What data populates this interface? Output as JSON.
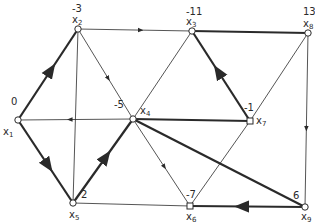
{
  "diagram": {
    "type": "directed-graph",
    "colors": {
      "edge": "#2a2a2a",
      "background": "#ffffff"
    },
    "nodes": [
      {
        "id": "x1",
        "name": "x",
        "sub": "1",
        "value": "0",
        "x": 18,
        "y": 120,
        "shape": "circle"
      },
      {
        "id": "x2",
        "name": "x",
        "sub": "2",
        "value": "-3",
        "x": 78,
        "y": 29,
        "shape": "circle"
      },
      {
        "id": "x3",
        "name": "x",
        "sub": "3",
        "value": "-11",
        "x": 192,
        "y": 31,
        "shape": "circle"
      },
      {
        "id": "x4",
        "name": "x",
        "sub": "4",
        "value": "-5",
        "x": 133,
        "y": 119,
        "shape": "circle"
      },
      {
        "id": "x5",
        "name": "x",
        "sub": "5",
        "value": "2",
        "x": 73,
        "y": 203,
        "shape": "circle"
      },
      {
        "id": "x6",
        "name": "x",
        "sub": "6",
        "value": "-7",
        "x": 190,
        "y": 206,
        "shape": "square"
      },
      {
        "id": "x7",
        "name": "x",
        "sub": "7",
        "value": "-1",
        "x": 250,
        "y": 121,
        "shape": "square"
      },
      {
        "id": "x8",
        "name": "x",
        "sub": "8",
        "value": "13",
        "x": 308,
        "y": 33,
        "shape": "circle"
      },
      {
        "id": "x9",
        "name": "x",
        "sub": "9",
        "value": "6",
        "x": 305,
        "y": 207,
        "shape": "circle"
      }
    ],
    "edges": [
      {
        "from": "x1",
        "to": "x2",
        "bold": true,
        "arrow": true
      },
      {
        "from": "x2",
        "to": "x3",
        "bold": false,
        "arrow": true
      },
      {
        "from": "x2",
        "to": "x4",
        "bold": false,
        "arrow": true
      },
      {
        "from": "x2",
        "to": "x5",
        "bold": false,
        "arrow": false
      },
      {
        "from": "x3",
        "to": "x8",
        "bold": true,
        "arrow": false
      },
      {
        "from": "x7",
        "to": "x3",
        "bold": true,
        "arrow": true
      },
      {
        "from": "x3",
        "to": "x4",
        "bold": false,
        "arrow": false
      },
      {
        "from": "x8",
        "to": "x7",
        "bold": false,
        "arrow": false
      },
      {
        "from": "x8",
        "to": "x9",
        "bold": false,
        "arrow": true
      },
      {
        "from": "x4",
        "to": "x1",
        "bold": false,
        "arrow": true
      },
      {
        "from": "x4",
        "to": "x7",
        "bold": true,
        "arrow": false
      },
      {
        "from": "x4",
        "to": "x9",
        "bold": true,
        "arrow": false
      },
      {
        "from": "x4",
        "to": "x6",
        "bold": false,
        "arrow": true
      },
      {
        "from": "x5",
        "to": "x4",
        "bold": true,
        "arrow": true
      },
      {
        "from": "x1",
        "to": "x5",
        "bold": true,
        "arrow": true
      },
      {
        "from": "x5",
        "to": "x6",
        "bold": false,
        "arrow": false
      },
      {
        "from": "x7",
        "to": "x6",
        "bold": false,
        "arrow": false
      },
      {
        "from": "x9",
        "to": "x6",
        "bold": true,
        "arrow": true
      }
    ],
    "labels": {
      "x1": {
        "value": "0",
        "value_pos": [
          11,
          97
        ],
        "name_pos": [
          3,
          127
        ]
      },
      "x2": {
        "value": "-3",
        "value_pos": [
          72,
          4
        ],
        "name_pos": [
          72,
          15
        ]
      },
      "x3": {
        "value": "-11",
        "value_pos": [
          186,
          7
        ],
        "name_pos": [
          186,
          17
        ]
      },
      "x4": {
        "value": "-5",
        "value_pos": [
          114,
          100
        ],
        "name_pos": [
          140,
          106
        ]
      },
      "x5": {
        "value": "2",
        "value_pos": [
          81,
          190
        ],
        "name_pos": [
          69,
          210
        ]
      },
      "x6": {
        "value": "-7",
        "value_pos": [
          186,
          190
        ],
        "name_pos": [
          186,
          212
        ]
      },
      "x7": {
        "value": "-1",
        "value_pos": [
          244,
          103
        ],
        "name_pos": [
          256,
          116
        ]
      },
      "x8": {
        "value": "13",
        "value_pos": [
          303,
          7
        ],
        "name_pos": [
          303,
          19
        ]
      },
      "x9": {
        "value": "6",
        "value_pos": [
          293,
          191
        ],
        "name_pos": [
          301,
          212
        ]
      }
    }
  }
}
